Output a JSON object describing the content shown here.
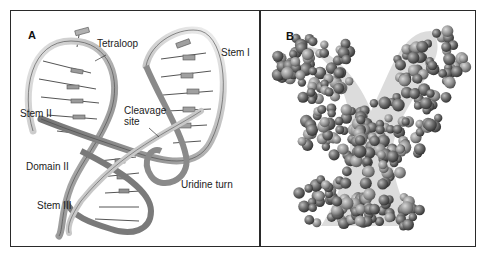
{
  "figure": {
    "panel_a": {
      "letter": "A",
      "title": "Ribbon diagram",
      "labels": {
        "tetraloop": "Tetraloop",
        "stem_i": "Stem I",
        "stem_ii": "Stem II",
        "cleavage_line1": "Cleavage",
        "cleavage_line2": "site",
        "domain_ii": "Domain II",
        "uridine_turn": "Uridine turn",
        "stem_iii": "Stem III"
      }
    },
    "panel_b": {
      "letter": "B",
      "title": "Space-filling model"
    },
    "colors": {
      "frame": "#2a2a2a",
      "ribbon_light": "#d8d8d8",
      "ribbon_dark": "#6a6a6a",
      "sphere_dark": "#4a4a4a",
      "sphere_light": "#9a9a9a"
    }
  }
}
